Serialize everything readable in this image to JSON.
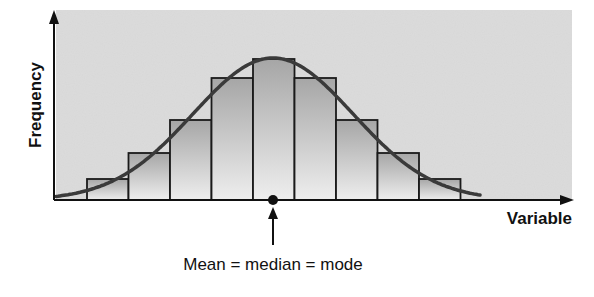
{
  "chart_data": {
    "type": "bar",
    "title": "",
    "xlabel": "Variable",
    "ylabel": "Frequency",
    "categories": [
      "1",
      "2",
      "3",
      "4",
      "5",
      "6",
      "7",
      "8",
      "9"
    ],
    "values": [
      21,
      47,
      80,
      122,
      141,
      122,
      80,
      47,
      21
    ],
    "value_note": "Relative bar heights estimated from pixels; the chart has no numeric tick labels.",
    "overlay": {
      "type": "line",
      "name": "Normal distribution curve",
      "shape": "symmetric bell curve"
    },
    "annotations": [
      {
        "text": "Mean = median = mode",
        "points_to": "center of distribution on x-axis (marked with dot and upward arrow)"
      }
    ],
    "grid": false,
    "legend": null,
    "axis_ticks": false,
    "colors": {
      "plot_background": "#dcdcdc",
      "bar_fill_light": "#ececec",
      "bar_fill_dark": "#a8a8a8",
      "bar_stroke": "#1a1a1a",
      "curve": "#3a3a3a",
      "axis": "#111111"
    }
  },
  "labels": {
    "y_axis": "Frequency",
    "x_axis": "Variable",
    "annotation": "Mean = median = mode"
  }
}
